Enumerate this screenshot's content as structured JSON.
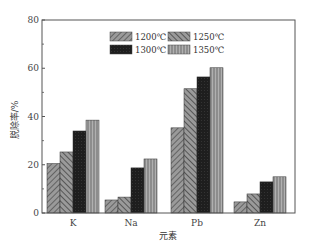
{
  "chart_data": {
    "type": "bar",
    "title": "",
    "xlabel": "元素",
    "ylabel": "脱除率/%",
    "categories": [
      "K",
      "Na",
      "Pb",
      "Zn"
    ],
    "series": [
      {
        "name": "1200℃",
        "values": [
          20.5,
          5.4,
          35.3,
          4.6
        ],
        "pattern": "hatch-diag-right",
        "color": "#7a7a7a"
      },
      {
        "name": "1250℃",
        "values": [
          25.3,
          6.6,
          51.5,
          7.9
        ],
        "pattern": "hatch-diag-left",
        "color": "#6a6a6a"
      },
      {
        "name": "1300℃",
        "values": [
          34.0,
          18.7,
          56.4,
          12.9
        ],
        "pattern": "solid-dark",
        "color": "#1e1e1e"
      },
      {
        "name": "1350℃",
        "values": [
          38.5,
          22.4,
          60.2,
          15.0
        ],
        "pattern": "vertical-lines",
        "color": "#8a8a8a"
      }
    ],
    "ylim": [
      0,
      80
    ],
    "yticks": [
      0,
      20,
      40,
      60,
      80
    ],
    "grid": false,
    "legend_position": "top-center-inside"
  }
}
